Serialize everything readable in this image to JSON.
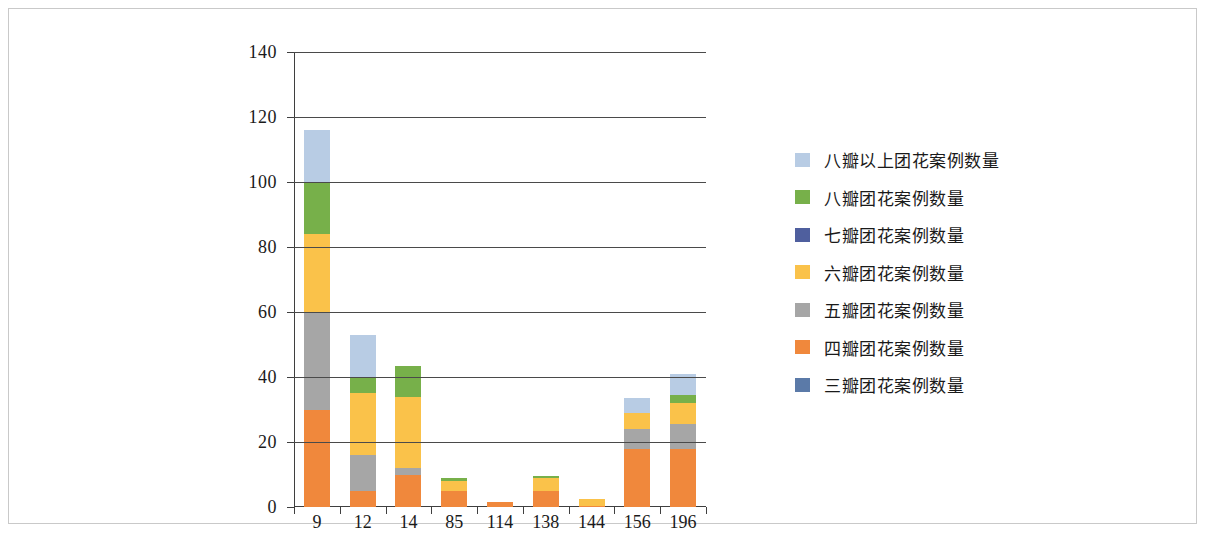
{
  "chart_data": {
    "type": "bar",
    "subtype": "stacked-column",
    "title": "",
    "xlabel": "",
    "ylabel": "",
    "ylim": [
      0,
      140
    ],
    "ytick_labels": [
      "0",
      "20",
      "40",
      "60",
      "80",
      "100",
      "120",
      "140"
    ],
    "yticks": [
      0,
      20,
      40,
      60,
      80,
      100,
      120,
      140
    ],
    "grid": "horizontal",
    "legend_position": "right",
    "categories": [
      "9",
      "12",
      "14",
      "85",
      "114",
      "138",
      "144",
      "156",
      "196"
    ],
    "series": [
      {
        "name": "三瓣团花案例数量",
        "color": "#5b7aa8",
        "values": [
          0,
          0,
          0,
          0,
          0,
          0,
          0,
          0,
          0
        ]
      },
      {
        "name": "四瓣团花案例数量",
        "color": "#f0883c",
        "values": [
          30,
          5,
          10,
          5,
          1.5,
          5,
          0.3,
          18,
          18
        ]
      },
      {
        "name": "五瓣团花案例数量",
        "color": "#a6a6a6",
        "values": [
          30,
          11,
          2,
          0,
          0,
          0,
          0,
          6,
          7.5
        ]
      },
      {
        "name": "六瓣团花案例数量",
        "color": "#fac24a",
        "values": [
          24,
          19,
          22,
          3,
          0,
          4,
          2.2,
          5,
          6.5
        ]
      },
      {
        "name": "七瓣团花案例数量",
        "color": "#4f5f9e",
        "values": [
          0,
          0,
          0,
          0,
          0,
          0,
          0,
          0,
          0
        ]
      },
      {
        "name": "八瓣团花案例数量",
        "color": "#77b04a",
        "values": [
          16,
          5,
          9.5,
          1,
          0,
          0.5,
          0,
          0,
          2.5
        ]
      },
      {
        "name": "八瓣以上团花案例数量",
        "color": "#b8cce4",
        "values": [
          16,
          13,
          0,
          0,
          0,
          0,
          0,
          4.5,
          6.5
        ]
      }
    ],
    "totals": [
      116,
      53,
      43.5,
      9,
      1.5,
      9.5,
      2.5,
      33.5,
      41
    ]
  },
  "legend": {
    "entries": [
      {
        "label": "八瓣以上团花案例数量",
        "color": "#b8cce4"
      },
      {
        "label": "八瓣团花案例数量",
        "color": "#77b04a"
      },
      {
        "label": "七瓣团花案例数量",
        "color": "#4f5f9e"
      },
      {
        "label": "六瓣团花案例数量",
        "color": "#fac24a"
      },
      {
        "label": "五瓣团花案例数量",
        "color": "#a6a6a6"
      },
      {
        "label": "四瓣团花案例数量",
        "color": "#f0883c"
      },
      {
        "label": "三瓣团花案例数量",
        "color": "#5b7aa8"
      }
    ]
  }
}
